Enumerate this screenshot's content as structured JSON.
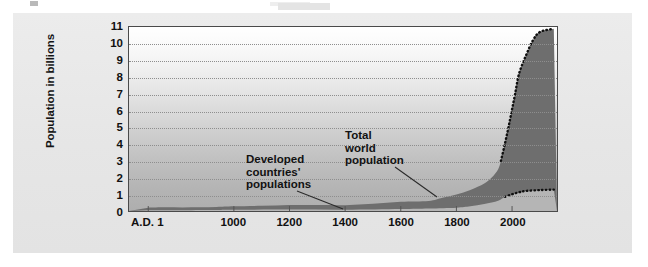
{
  "chart_data": {
    "type": "area",
    "title": "",
    "subtitle": "",
    "xlabel": "",
    "ylabel": "Population in billions",
    "xlim": [
      1,
      2150
    ],
    "ylim": [
      0,
      11
    ],
    "grid": true,
    "legend_position": "inline-annotations",
    "y_ticks": [
      0,
      1,
      2,
      3,
      4,
      5,
      6,
      7,
      8,
      9,
      10,
      11
    ],
    "y_tick_labels": [
      "0",
      "1",
      "2",
      "3",
      "4",
      "5",
      "6",
      "7",
      "8",
      "9",
      "10",
      "11"
    ],
    "x_ticks": [
      1,
      1000,
      1200,
      1400,
      1600,
      1800,
      2000
    ],
    "x_tick_labels": [
      "A.D. 1",
      "1000",
      "1200",
      "1400",
      "1600",
      "1800",
      "2000"
    ],
    "series": [
      {
        "name": "Total world population",
        "color": "#6e6e6e",
        "x": [
          1,
          200,
          400,
          600,
          800,
          1000,
          1100,
          1200,
          1300,
          1400,
          1500,
          1600,
          1700,
          1750,
          1800,
          1850,
          1900,
          1927,
          1950,
          1960,
          1974,
          1987,
          1999,
          2011,
          2025,
          2050,
          2075,
          2100,
          2150
        ],
        "values": [
          0.2,
          0.22,
          0.21,
          0.22,
          0.24,
          0.28,
          0.31,
          0.36,
          0.36,
          0.35,
          0.43,
          0.55,
          0.6,
          0.79,
          0.98,
          1.26,
          1.65,
          2.0,
          2.5,
          3.0,
          4.0,
          5.0,
          6.0,
          7.0,
          8.2,
          9.3,
          10.2,
          10.7,
          10.9
        ]
      },
      {
        "name": "Developed countries' populations",
        "color": "#b5b5b5",
        "x": [
          1,
          400,
          800,
          1000,
          1200,
          1400,
          1600,
          1700,
          1800,
          1850,
          1900,
          1950,
          1975,
          2000,
          2025,
          2050,
          2100,
          2150
        ],
        "values": [
          0.05,
          0.05,
          0.06,
          0.07,
          0.09,
          0.08,
          0.12,
          0.15,
          0.2,
          0.28,
          0.42,
          0.62,
          0.85,
          1.0,
          1.12,
          1.2,
          1.25,
          1.28
        ]
      }
    ],
    "projection": {
      "label": "projected",
      "style": "dotted",
      "color": "#101010",
      "start_year": 1960
    },
    "annotations": [
      {
        "text": "Developed\ncountries'\npopulations",
        "target_year": 1760,
        "target_value": 0.35
      },
      {
        "text": "Total\nworld\npopulation",
        "target_year": 1810,
        "target_value": 1.15
      }
    ]
  },
  "axis": {
    "y_title": "Population in billions"
  },
  "colors": {
    "panel_background": "#e8e8e8",
    "plot_border": "#4a4a4a",
    "gridline": "#8e8e8e",
    "total_world_fill": "#6e6e6e",
    "developed_fill": "#b5b5b5",
    "text": "#121212",
    "projection_dots": "#101010"
  }
}
